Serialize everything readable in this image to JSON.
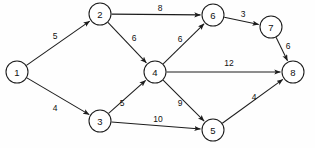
{
  "diagram": {
    "type": "directed-weighted-graph",
    "background_color": "#fefefe",
    "stroke_color": "#1c1c1c",
    "node_fill_color": "#ffffff",
    "node_radius": 11,
    "arrowhead": "filled-triangle",
    "nodes": [
      {
        "id": "1",
        "label": "1",
        "x": 17,
        "y": 72
      },
      {
        "id": "2",
        "label": "2",
        "x": 100,
        "y": 14
      },
      {
        "id": "3",
        "label": "3",
        "x": 100,
        "y": 121
      },
      {
        "id": "4",
        "label": "4",
        "x": 155,
        "y": 72
      },
      {
        "id": "5",
        "label": "5",
        "x": 213,
        "y": 130
      },
      {
        "id": "6",
        "label": "6",
        "x": 213,
        "y": 15
      },
      {
        "id": "7",
        "label": "7",
        "x": 271,
        "y": 27
      },
      {
        "id": "8",
        "label": "8",
        "x": 293,
        "y": 72
      }
    ],
    "edges": [
      {
        "from": "1",
        "to": "2",
        "weight": "5",
        "lx": 55,
        "ly": 36
      },
      {
        "from": "1",
        "to": "3",
        "weight": "4",
        "lx": 55,
        "ly": 108
      },
      {
        "from": "2",
        "to": "6",
        "weight": "8",
        "lx": 160,
        "ly": 8
      },
      {
        "from": "2",
        "to": "4",
        "weight": "6",
        "lx": 134,
        "ly": 38
      },
      {
        "from": "3",
        "to": "4",
        "weight": "5",
        "lx": 122,
        "ly": 103
      },
      {
        "from": "3",
        "to": "5",
        "weight": "10",
        "lx": 158,
        "ly": 119
      },
      {
        "from": "4",
        "to": "6",
        "weight": "6",
        "lx": 180,
        "ly": 39
      },
      {
        "from": "4",
        "to": "8",
        "weight": "12",
        "lx": 229,
        "ly": 63
      },
      {
        "from": "4",
        "to": "5",
        "weight": "9",
        "lx": 180,
        "ly": 103
      },
      {
        "from": "6",
        "to": "7",
        "weight": "3",
        "lx": 243,
        "ly": 14
      },
      {
        "from": "7",
        "to": "8",
        "weight": "6",
        "lx": 288,
        "ly": 46
      },
      {
        "from": "5",
        "to": "8",
        "weight": "4",
        "lx": 254,
        "ly": 97
      }
    ]
  }
}
